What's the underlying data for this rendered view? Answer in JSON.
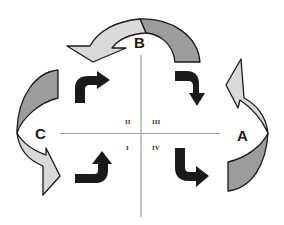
{
  "diagram": {
    "type": "cycle-quadrant",
    "nodes": [
      {
        "id": "A",
        "label": "A",
        "position": "right"
      },
      {
        "id": "B",
        "label": "B",
        "position": "top"
      },
      {
        "id": "C",
        "label": "C",
        "position": "left"
      }
    ],
    "quadrants": [
      {
        "id": "II",
        "label": "II",
        "position": "top-left"
      },
      {
        "id": "III",
        "label": "III",
        "position": "top-right"
      },
      {
        "id": "I",
        "label": "I",
        "position": "bottom-left"
      },
      {
        "id": "IV",
        "label": "IV",
        "position": "bottom-right"
      }
    ],
    "cycle_arrows": [
      {
        "from": "A",
        "to": "B",
        "shape": "curved-ribbon",
        "direction": "up"
      },
      {
        "from": "B",
        "to": "C",
        "shape": "curved-ribbon",
        "direction": "over-top-to-left"
      },
      {
        "from": "C",
        "to": "A",
        "shape": "curved-ribbon",
        "direction": "down"
      }
    ],
    "inner_arrows": [
      {
        "quadrant": "II",
        "shape": "bent",
        "direction": "up-then-right"
      },
      {
        "quadrant": "III",
        "shape": "bent",
        "direction": "right-then-down"
      },
      {
        "quadrant": "I",
        "shape": "bent",
        "direction": "right-then-up"
      },
      {
        "quadrant": "IV",
        "shape": "bent",
        "direction": "down-then-right"
      }
    ],
    "colors": {
      "ribbon_dark": "#9c9c9c",
      "ribbon_light": "#d9d9d9",
      "inner_arrow": "#1a1a1a",
      "axis": "#a0a0a0",
      "outline": "#1a1a1a"
    }
  }
}
